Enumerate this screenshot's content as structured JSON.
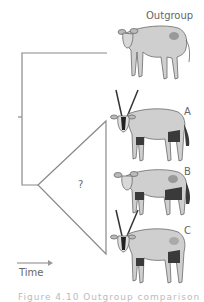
{
  "figure": {
    "taxa": [
      {
        "id": "outgroup",
        "label": "Outgroup",
        "horns": false
      },
      {
        "id": "A",
        "label": "A",
        "horns": true
      },
      {
        "id": "B",
        "label": "B",
        "horns": false
      },
      {
        "id": "C",
        "label": "C",
        "horns": true
      }
    ],
    "clade_unknown_label": "?",
    "time_axis_label": "Time",
    "caption": "Figure 4.10 Outgroup comparison"
  },
  "colors": {
    "tree_line": "#8a8a8a",
    "animal_body": "#cfcfcf",
    "animal_outline": "#6a6a6a",
    "animal_dark": "#3a3a3a",
    "label_text": "#666666"
  }
}
